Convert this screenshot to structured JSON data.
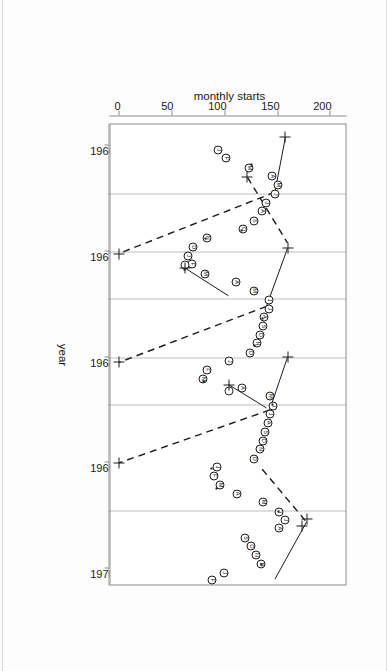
{
  "chart_data": {
    "type": "scatter",
    "title": "",
    "subtitle": "",
    "xlabel": "year",
    "ylabel": "monthly starts",
    "xlim": [
      1965.8,
      1970.15
    ],
    "ylim": [
      -8,
      215
    ],
    "xticks": [
      1966,
      1967,
      1968,
      1969,
      1970
    ],
    "xticklabels": [
      "1966",
      "1967",
      "1968",
      "1969",
      "1970"
    ],
    "yticks": [
      0,
      50,
      100,
      150,
      200
    ],
    "yticklabels": [
      "0",
      "50",
      "100",
      "150",
      "200"
    ],
    "grid": "vertical dotted gridlines at year boundaries and mid-year",
    "gridlines_x": [
      1966.45,
      1967.0,
      1967.45,
      1968.0,
      1968.45,
      1969.45
    ],
    "legend": "none",
    "point_labels": "month initials J F M A M J J A S O N D plotted inside open circles",
    "series": [
      {
        "name": "monthly starts",
        "marker": "circle with month letter",
        "points": [
          {
            "x": 1966.04,
            "y": 94,
            "label": "J"
          },
          {
            "x": 1966.12,
            "y": 102,
            "label": "F"
          },
          {
            "x": 1966.21,
            "y": 123,
            "label": "M"
          },
          {
            "x": 1966.29,
            "y": 145,
            "label": "A"
          },
          {
            "x": 1966.37,
            "y": 151,
            "label": "M"
          },
          {
            "x": 1966.46,
            "y": 148,
            "label": "J"
          },
          {
            "x": 1966.54,
            "y": 140,
            "label": "J"
          },
          {
            "x": 1966.62,
            "y": 136,
            "label": "A"
          },
          {
            "x": 1966.71,
            "y": 128,
            "label": "S"
          },
          {
            "x": 1966.79,
            "y": 118,
            "label": "O"
          },
          {
            "x": 1966.87,
            "y": 84,
            "label": "N"
          },
          {
            "x": 1966.96,
            "y": 70,
            "label": "D"
          },
          {
            "x": 1967.04,
            "y": 66,
            "label": "J"
          },
          {
            "x": 1967.12,
            "y": 69,
            "label": "F"
          },
          {
            "x": 1967.21,
            "y": 82,
            "label": "M"
          },
          {
            "x": 1967.29,
            "y": 111,
            "label": "A"
          },
          {
            "x": 1967.37,
            "y": 128,
            "label": "M"
          },
          {
            "x": 1967.46,
            "y": 142,
            "label": "J"
          },
          {
            "x": 1967.54,
            "y": 142,
            "label": "J"
          },
          {
            "x": 1967.62,
            "y": 138,
            "label": "A"
          },
          {
            "x": 1967.71,
            "y": 137,
            "label": "S"
          },
          {
            "x": 1967.79,
            "y": 134,
            "label": "O"
          },
          {
            "x": 1967.87,
            "y": 131,
            "label": "N"
          },
          {
            "x": 1967.96,
            "y": 124,
            "label": "D"
          },
          {
            "x": 1968.04,
            "y": 104,
            "label": "J"
          },
          {
            "x": 1968.12,
            "y": 84,
            "label": "F"
          },
          {
            "x": 1968.21,
            "y": 80,
            "label": "M"
          },
          {
            "x": 1968.29,
            "y": 117,
            "label": "A"
          },
          {
            "x": 1968.37,
            "y": 143,
            "label": "M"
          },
          {
            "x": 1968.46,
            "y": 146,
            "label": "J"
          },
          {
            "x": 1968.54,
            "y": 143,
            "label": "J"
          },
          {
            "x": 1968.62,
            "y": 141,
            "label": "A"
          },
          {
            "x": 1968.71,
            "y": 139,
            "label": "S"
          },
          {
            "x": 1968.79,
            "y": 137,
            "label": "O"
          },
          {
            "x": 1968.87,
            "y": 134,
            "label": "N"
          },
          {
            "x": 1968.96,
            "y": 128,
            "label": "D"
          },
          {
            "x": 1969.04,
            "y": 93,
            "label": "J"
          },
          {
            "x": 1969.12,
            "y": 90,
            "label": "F"
          },
          {
            "x": 1969.21,
            "y": 96,
            "label": "M"
          },
          {
            "x": 1969.29,
            "y": 112,
            "label": "A"
          },
          {
            "x": 1969.37,
            "y": 137,
            "label": "M"
          },
          {
            "x": 1969.46,
            "y": 152,
            "label": "J"
          },
          {
            "x": 1969.54,
            "y": 158,
            "label": "J"
          },
          {
            "x": 1969.62,
            "y": 152,
            "label": "A"
          },
          {
            "x": 1969.71,
            "y": 120,
            "label": "S"
          },
          {
            "x": 1969.79,
            "y": 125,
            "label": "O"
          },
          {
            "x": 1969.87,
            "y": 130,
            "label": "N"
          },
          {
            "x": 1969.96,
            "y": 135,
            "label": "D"
          },
          {
            "x": 1970.04,
            "y": 100,
            "label": "J"
          },
          {
            "x": 1970.11,
            "y": 88,
            "label": "F"
          }
        ]
      }
    ],
    "open_circles": [
      {
        "x": 1967.13,
        "y": 63
      },
      {
        "x": 1968.32,
        "y": 104
      }
    ],
    "small_dots": [
      {
        "x": 1966.18,
        "y": 126
      },
      {
        "x": 1966.8,
        "y": 116
      },
      {
        "x": 1966.88,
        "y": 82
      },
      {
        "x": 1967.17,
        "y": 62
      },
      {
        "x": 1967.63,
        "y": 136
      },
      {
        "x": 1967.89,
        "y": 129
      },
      {
        "x": 1968.23,
        "y": 80
      },
      {
        "x": 1968.45,
        "y": 146
      },
      {
        "x": 1969.05,
        "y": 88
      },
      {
        "x": 1969.24,
        "y": 93
      },
      {
        "x": 1969.46,
        "y": 151
      },
      {
        "x": 1969.96,
        "y": 135
      }
    ],
    "fitted_segments": [
      {
        "style": "solid",
        "x1": 1965.92,
        "y1": 158,
        "x2": 1966.44,
        "y2": 148
      },
      {
        "style": "dashed",
        "x1": 1966.44,
        "y1": 148,
        "x2": 1967.02,
        "y2": 0
      },
      {
        "style": "dashed",
        "x1": 1966.3,
        "y1": 122,
        "x2": 1966.92,
        "y2": 160
      },
      {
        "style": "solid",
        "x1": 1966.97,
        "y1": 160,
        "x2": 1967.52,
        "y2": 140
      },
      {
        "style": "dashed",
        "x1": 1967.52,
        "y1": 140,
        "x2": 1968.05,
        "y2": 0
      },
      {
        "style": "solid",
        "x1": 1967.16,
        "y1": 63,
        "x2": 1967.42,
        "y2": 104
      },
      {
        "style": "solid",
        "x1": 1968.0,
        "y1": 160,
        "x2": 1968.5,
        "y2": 143
      },
      {
        "style": "dashed",
        "x1": 1968.5,
        "y1": 143,
        "x2": 1969.0,
        "y2": 0
      },
      {
        "style": "solid",
        "x1": 1968.26,
        "y1": 104,
        "x2": 1968.48,
        "y2": 140
      },
      {
        "style": "dashed",
        "x1": 1969.06,
        "y1": 136,
        "x2": 1969.56,
        "y2": 178
      },
      {
        "style": "solid",
        "x1": 1969.56,
        "y1": 178,
        "x2": 1970.1,
        "y2": 148
      }
    ],
    "plus_markers": [
      {
        "x": 1965.92,
        "y": 158
      },
      {
        "x": 1967.02,
        "y": 0
      },
      {
        "x": 1966.3,
        "y": 122
      },
      {
        "x": 1966.97,
        "y": 160
      },
      {
        "x": 1968.05,
        "y": 0
      },
      {
        "x": 1967.16,
        "y": 63
      },
      {
        "x": 1968.0,
        "y": 160
      },
      {
        "x": 1969.0,
        "y": 0
      },
      {
        "x": 1968.26,
        "y": 104
      },
      {
        "x": 1969.53,
        "y": 178
      },
      {
        "x": 1969.6,
        "y": 174
      }
    ]
  }
}
